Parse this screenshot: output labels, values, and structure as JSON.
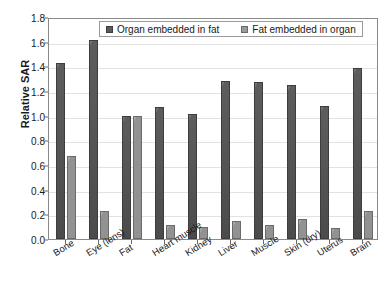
{
  "chart_data": {
    "type": "bar",
    "title": "",
    "xlabel": "",
    "ylabel": "Relative SAR",
    "ylim": [
      0.0,
      1.8
    ],
    "ytick_labels": [
      "0.0",
      "0.2",
      "0.4",
      "0.6",
      "0.8",
      "1.0",
      "1.2",
      "1.4",
      "1.6",
      "1.8"
    ],
    "ytick_values": [
      0.0,
      0.2,
      0.4,
      0.6,
      0.8,
      1.0,
      1.2,
      1.4,
      1.6,
      1.8
    ],
    "grid": true,
    "legend_position": "top-center",
    "categories": [
      "Bone",
      "Eye (lens)",
      "Fat",
      "Heart muscle",
      "Kidney",
      "Liver",
      "Muscle",
      "Skin (dry)",
      "Uterus",
      "Brain"
    ],
    "series": [
      {
        "name": "Organ embedded in fat",
        "color": "#595959",
        "values": [
          1.43,
          1.61,
          1.0,
          1.07,
          1.01,
          1.28,
          1.27,
          1.25,
          1.08,
          1.39
        ]
      },
      {
        "name": "Fat embedded in organ",
        "color": "#9a9a9a",
        "values": [
          0.67,
          0.23,
          1.0,
          0.11,
          0.1,
          0.15,
          0.11,
          0.16,
          0.09,
          0.23
        ]
      }
    ]
  },
  "legend": {
    "items": [
      {
        "label": "Organ embedded in fat"
      },
      {
        "label": "Fat embedded in organ"
      }
    ]
  },
  "axes": {
    "y_title": "Relative SAR"
  }
}
